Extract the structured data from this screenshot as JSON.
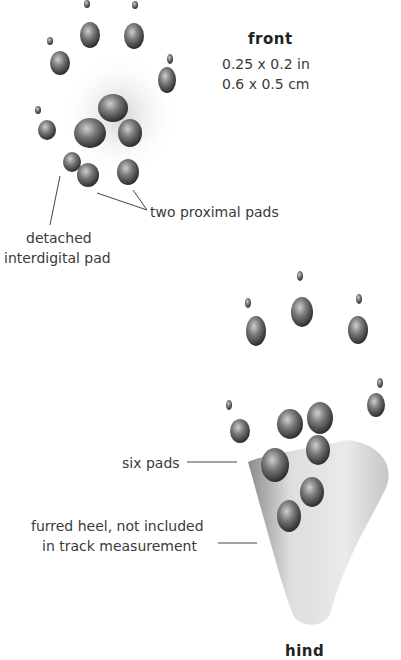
{
  "front": {
    "title": "front",
    "size_in": "0.25 x 0.2 in",
    "size_cm": "0.6 x 0.5 cm",
    "labels": {
      "proximal": "two proximal pads",
      "detached_1": "detached",
      "detached_2": "interdigital pad"
    }
  },
  "hind": {
    "title": "hind",
    "labels": {
      "six_pads": "six pads",
      "heel_1": "furred heel, not included",
      "heel_2": "in track measurement"
    }
  }
}
